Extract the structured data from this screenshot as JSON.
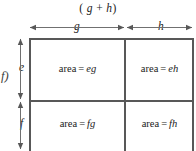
{
  "figure": {
    "label": "f)",
    "top_expression": "( g + h )",
    "top_expression_parts": {
      "open": "(",
      "left_var": "g",
      "operator": "+",
      "right_var": "h",
      "close": ")"
    },
    "width_labels": {
      "left": "g",
      "right": "h"
    },
    "height_labels": {
      "top": "e",
      "bottom": "f"
    },
    "cells": [
      {
        "position": "top-left",
        "prefix": "area",
        "equals": "=",
        "expression": "eg"
      },
      {
        "position": "top-right",
        "prefix": "area",
        "equals": "=",
        "expression": "eh"
      },
      {
        "position": "bottom-left",
        "prefix": "area",
        "equals": "=",
        "expression": "fg"
      },
      {
        "position": "bottom-right",
        "prefix": "area",
        "equals": "=",
        "expression": "fh"
      }
    ],
    "colors": {
      "line": "#585858",
      "text": "#1a1a1a",
      "background": "#ffffff"
    }
  }
}
